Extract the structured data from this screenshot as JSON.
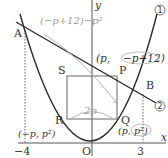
{
  "diagram": {
    "type": "coordinate-geometry",
    "axes": {
      "x_label": "x",
      "y_label": "y",
      "origin_label": "O"
    },
    "ticks": {
      "x_neg": "−4",
      "x_pos": "3"
    },
    "curves": [
      {
        "id": "1",
        "marker": "1",
        "desc": "parabola y = x²"
      },
      {
        "id": "2",
        "marker": "2",
        "desc": "line through A and B, y = −x + 12"
      }
    ],
    "points": {
      "A": "A",
      "B": "B",
      "P": "P",
      "Q": "Q",
      "R": "R",
      "S": "S"
    },
    "annotations": {
      "P_coord": "(p, −p+12)",
      "P_coord_prefix": "(p,",
      "P_coord_circled": "−p+12)",
      "Q_coord_prefix": "(p,",
      "Q_coord_circled": "p²)",
      "R_coord": "(−p, p²)",
      "side_label": "(−p+12)−p²",
      "width_label": "2p"
    },
    "colors": {
      "curve": "#2b2b2b",
      "axis": "#555555",
      "square": "#808080",
      "annotation": "#9a9a9a"
    }
  }
}
